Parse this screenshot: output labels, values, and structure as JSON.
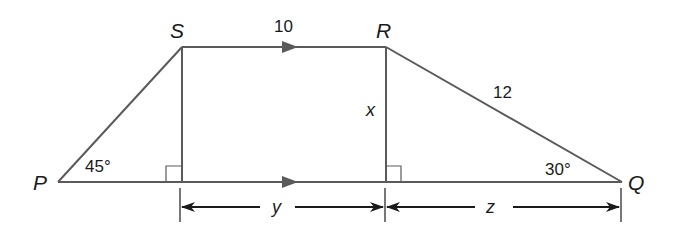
{
  "diagram": {
    "type": "trapezoid",
    "colors": {
      "edge": "#5a5a5a",
      "dimension": "#1a1a1a",
      "text": "#1a1a1a",
      "background": "#ffffff"
    },
    "vertices": {
      "P": {
        "label": "P"
      },
      "S": {
        "label": "S"
      },
      "R": {
        "label": "R"
      },
      "Q": {
        "label": "Q"
      }
    },
    "sides": {
      "SR": {
        "label": "10",
        "parallel_mark": true
      },
      "RQ": {
        "label": "12"
      },
      "PQ": {
        "parallel_mark": true
      }
    },
    "heights": {
      "R_altitude": {
        "label": "x"
      }
    },
    "angles": {
      "P": {
        "label": "45°"
      },
      "Q": {
        "label": "30°"
      }
    },
    "dimensions": {
      "y": {
        "label": "y"
      },
      "z": {
        "label": "z"
      }
    }
  }
}
